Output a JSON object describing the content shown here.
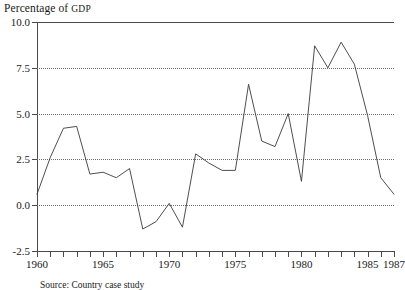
{
  "chart_data": {
    "type": "line",
    "title": "Percentage of GDP",
    "title_main": "Percentage of ",
    "title_smallcaps": "GDP",
    "xlabel": "",
    "ylabel": "",
    "ylim": [
      -2.5,
      10.0
    ],
    "xlim": [
      1960,
      1987
    ],
    "grid": true,
    "gridlines_y": [
      7.5,
      5.0,
      2.5,
      0.0
    ],
    "legend": null,
    "yticks": [
      10.0,
      7.5,
      5.0,
      2.5,
      0.0,
      -2.5
    ],
    "ytick_labels": [
      "10.0",
      "7.5",
      "5.0",
      "2.5",
      "0.0",
      "-2.5"
    ],
    "xticks": [
      1960,
      1961,
      1962,
      1963,
      1964,
      1965,
      1966,
      1967,
      1968,
      1969,
      1970,
      1971,
      1972,
      1973,
      1974,
      1975,
      1976,
      1977,
      1978,
      1979,
      1980,
      1981,
      1982,
      1983,
      1984,
      1985,
      1986,
      1987
    ],
    "xtick_labels_shown": [
      {
        "year": 1960,
        "label": "1960"
      },
      {
        "year": 1965,
        "label": "1965"
      },
      {
        "year": 1970,
        "label": "1970"
      },
      {
        "year": 1975,
        "label": "1975"
      },
      {
        "year": 1980,
        "label": "1980"
      },
      {
        "year": 1985,
        "label": "1985"
      },
      {
        "year": 1987,
        "label": "1987"
      }
    ],
    "x": [
      1960,
      1961,
      1962,
      1963,
      1964,
      1965,
      1966,
      1967,
      1968,
      1969,
      1970,
      1971,
      1972,
      1973,
      1974,
      1975,
      1976,
      1977,
      1978,
      1979,
      1980,
      1981,
      1982,
      1983,
      1984,
      1985,
      1986,
      1987
    ],
    "values": [
      0.6,
      2.6,
      4.2,
      4.3,
      1.7,
      1.8,
      1.5,
      2.0,
      -1.3,
      -0.9,
      0.1,
      -1.2,
      2.8,
      2.3,
      1.9,
      1.9,
      6.6,
      3.5,
      3.2,
      5.0,
      1.3,
      8.7,
      7.5,
      8.9,
      7.7,
      4.9,
      1.5,
      0.6
    ],
    "series_color": "#3a3a3a",
    "grid_color": "#6f6f6f",
    "axis_color": "#4a4a4a"
  },
  "footer": {
    "source_note": "Source: Country case study"
  }
}
